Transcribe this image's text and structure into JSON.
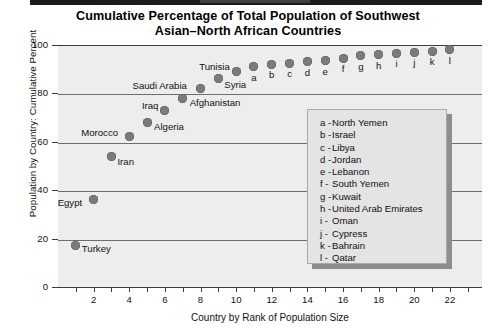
{
  "chart_data": {
    "type": "scatter",
    "title": "Cumulative Percentage of Total Population of Southwest Asian–North African Countries",
    "title_line1": "Cumulative Percentage of Total Population of Southwest",
    "title_line2": "Asian–North African Countries",
    "xlabel": "Country by Rank of Population Size",
    "ylabel": "Population by Country:  Cumulative Percent",
    "xlim": [
      0,
      23.8
    ],
    "ylim": [
      0,
      100
    ],
    "xticks": [
      2,
      4,
      6,
      8,
      10,
      12,
      14,
      16,
      18,
      20,
      22
    ],
    "yticks": [
      0,
      20,
      40,
      60,
      80,
      100
    ],
    "grid": "horizontal",
    "legend_position": "inside-right",
    "marker_color": "#7b7b7b",
    "plot_background": "#ededed",
    "points": [
      {
        "rank": 1,
        "label": "Turkey",
        "letter": "",
        "value": 17,
        "label_dx": 6,
        "label_dy": 3
      },
      {
        "rank": 2,
        "label": "Egypt",
        "letter": "",
        "value": 36,
        "label_dx": -36,
        "label_dy": 3
      },
      {
        "rank": 3,
        "label": "Iran",
        "letter": "",
        "value": 54,
        "label_dx": 6,
        "label_dy": 6
      },
      {
        "rank": 4,
        "label": "Morocco",
        "letter": "",
        "value": 62,
        "label_dx": -48,
        "label_dy": -4
      },
      {
        "rank": 5,
        "label": "Algeria",
        "letter": "",
        "value": 68,
        "label_dx": 7,
        "label_dy": 5
      },
      {
        "rank": 6,
        "label": "Iraq",
        "letter": "",
        "value": 73,
        "label_dx": -23,
        "label_dy": -4
      },
      {
        "rank": 7,
        "label": "Afghanistan",
        "letter": "",
        "value": 78,
        "label_dx": 7,
        "label_dy": 5
      },
      {
        "rank": 8,
        "label": "Saudi Arabia",
        "letter": "",
        "value": 82,
        "label_dx": -68,
        "label_dy": -3
      },
      {
        "rank": 9,
        "label": "Syria",
        "letter": "",
        "value": 86,
        "label_dx": 6,
        "label_dy": 6
      },
      {
        "rank": 10,
        "label": "Tunisia",
        "letter": "",
        "value": 89,
        "label_dx": -37,
        "label_dy": -5
      },
      {
        "rank": 11,
        "label": "",
        "letter": "a",
        "value": 91,
        "label_dx": 0,
        "label_dy": 0
      },
      {
        "rank": 12,
        "label": "",
        "letter": "b",
        "value": 92,
        "label_dx": 0,
        "label_dy": 0
      },
      {
        "rank": 13,
        "label": "",
        "letter": "c",
        "value": 92.5,
        "label_dx": 0,
        "label_dy": 0
      },
      {
        "rank": 14,
        "label": "",
        "letter": "d",
        "value": 93,
        "label_dx": 0,
        "label_dy": 0
      },
      {
        "rank": 15,
        "label": "",
        "letter": "e",
        "value": 93.5,
        "label_dx": 0,
        "label_dy": 0
      },
      {
        "rank": 16,
        "label": "",
        "letter": "f",
        "value": 94.5,
        "label_dx": 0,
        "label_dy": 0
      },
      {
        "rank": 17,
        "label": "",
        "letter": "g",
        "value": 95.5,
        "label_dx": 0,
        "label_dy": 0
      },
      {
        "rank": 18,
        "label": "",
        "letter": "h",
        "value": 96,
        "label_dx": 0,
        "label_dy": 0
      },
      {
        "rank": 19,
        "label": "",
        "letter": "i",
        "value": 96.5,
        "label_dx": 0,
        "label_dy": 0
      },
      {
        "rank": 20,
        "label": "",
        "letter": "j",
        "value": 97,
        "label_dx": 0,
        "label_dy": 0
      },
      {
        "rank": 21,
        "label": "",
        "letter": "k",
        "value": 97.5,
        "label_dx": 0,
        "label_dy": 0
      },
      {
        "rank": 22,
        "label": "",
        "letter": "l",
        "value": 98,
        "label_dx": 0,
        "label_dy": 0
      }
    ],
    "legend_entries": [
      {
        "key": "a -",
        "name": "North Yemen"
      },
      {
        "key": "b -",
        "name": "Israel"
      },
      {
        "key": "c -",
        "name": "Libya"
      },
      {
        "key": "d -",
        "name": "Jordan"
      },
      {
        "key": "e -",
        "name": "Lebanon"
      },
      {
        "key": "f -",
        "name": "South Yemen"
      },
      {
        "key": "g -",
        "name": "Kuwait"
      },
      {
        "key": "h -",
        "name": "United Arab Emirates"
      },
      {
        "key": "i -",
        "name": "Oman"
      },
      {
        "key": "j -",
        "name": "Cypress"
      },
      {
        "key": "k -",
        "name": "Bahrain"
      },
      {
        "key": "l -",
        "name": "Qatar"
      }
    ]
  }
}
